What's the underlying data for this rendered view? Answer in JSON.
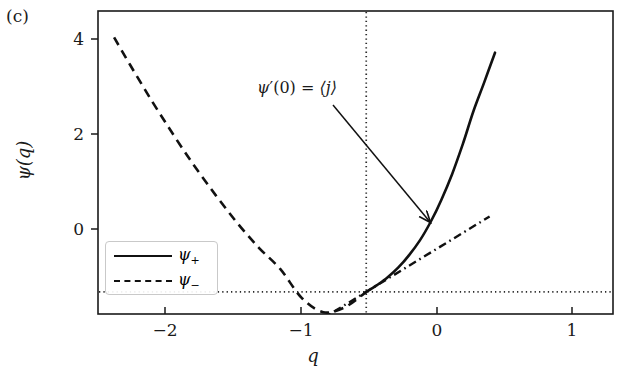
{
  "figure": {
    "panel_label": "(c)",
    "background_color": "#ffffff",
    "line_color": "#111111",
    "guide_color": "#333333"
  },
  "annotation": {
    "psi_symbol": "ψ",
    "prime": "′",
    "arg": "(0)",
    "equals": " = ",
    "expectation": "⟨j⟩",
    "full_text": "ψ′(0) = ⟨j⟩",
    "arrow_from_x": 333,
    "arrow_from_y": 105,
    "arrow_to_x": 434,
    "arrow_to_y": 226
  },
  "legend": {
    "position": "lower left",
    "entries": [
      {
        "label_base": "ψ",
        "label_sub": "+",
        "style": "solid"
      },
      {
        "label_base": "ψ",
        "label_sub": "−",
        "style": "dashed"
      }
    ]
  },
  "chart_data": {
    "type": "line",
    "title": "",
    "subtitle": "",
    "panel": "(c)",
    "xlabel": "q",
    "ylabel": "ψ(q)",
    "xlim": [
      -2.5,
      2.3
    ],
    "ylim": [
      -0.36,
      4.58
    ],
    "xticks": [
      -2,
      -1,
      0,
      1
    ],
    "xticklabels": [
      "−2",
      "−1",
      "0",
      "1"
    ],
    "yticks": [
      0,
      2,
      4
    ],
    "yticklabels": [
      "0",
      "2",
      "4"
    ],
    "grid": false,
    "guides": [
      {
        "name": "horizontal-zero-line",
        "type": "hline",
        "y": 0,
        "style": "dotted"
      },
      {
        "name": "vertical-zero-line",
        "type": "vline",
        "x": 0,
        "style": "dotted"
      }
    ],
    "annotations": [
      {
        "text": "ψ′(0) = ⟨j⟩",
        "point_x": 0.0,
        "point_y": 0.0,
        "arrow": true
      }
    ],
    "series": [
      {
        "name": "ψ+",
        "legend_label": "ψ₊",
        "style": "solid",
        "color": "#111111",
        "x": [
          0.0,
          0.1,
          0.2,
          0.3,
          0.4,
          0.5,
          0.6,
          0.7,
          0.8,
          0.9,
          1.0,
          1.1,
          1.2
        ],
        "y": [
          0.0,
          0.11,
          0.24,
          0.4,
          0.6,
          0.84,
          1.14,
          1.5,
          1.92,
          2.41,
          2.95,
          3.42,
          3.9
        ]
      },
      {
        "name": "ψ−",
        "legend_label": "ψ₋",
        "style": "dashed",
        "color": "#111111",
        "x": [
          -2.35,
          -2.2,
          -2.0,
          -1.8,
          -1.6,
          -1.4,
          -1.2,
          -1.0,
          -0.8,
          -0.6,
          -0.4,
          -0.2,
          0.0
        ],
        "y": [
          4.15,
          3.7,
          3.12,
          2.57,
          2.05,
          1.57,
          1.12,
          0.72,
          0.37,
          -0.1,
          -0.33,
          -0.25,
          0.0
        ]
      },
      {
        "name": "tangent-at-origin",
        "legend_label": "",
        "style": "dashdot",
        "color": "#111111",
        "slope": 1.07,
        "x": [
          -1.0,
          1.15
        ],
        "y": [
          -1.07,
          1.23
        ]
      }
    ]
  }
}
